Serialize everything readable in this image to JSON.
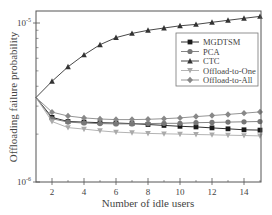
{
  "chart_data": {
    "type": "line",
    "title": "",
    "xlabel": "Number of idle users",
    "ylabel": "Offloading failure probability",
    "xlim": [
      1,
      15
    ],
    "ylim": [
      1e-06,
      1.2e-05
    ],
    "yscale": "log",
    "x_ticks": [
      2,
      4,
      6,
      8,
      10,
      12,
      14
    ],
    "y_tick_labels": [
      "10^-6",
      "10^-5"
    ],
    "grid": false,
    "legend_position": "upper right (inside)",
    "x": [
      1,
      2,
      3,
      4,
      5,
      6,
      7,
      8,
      9,
      10,
      11,
      12,
      13,
      14,
      15
    ],
    "series": [
      {
        "name": "MGDTSM",
        "marker": "square",
        "color": "#1a1a1a",
        "values": [
          3.4e-06,
          2.55e-06,
          2.4e-06,
          2.38e-06,
          2.36e-06,
          2.35e-06,
          2.33e-06,
          2.3e-06,
          2.27e-06,
          2.24e-06,
          2.22e-06,
          2.19e-06,
          2.16e-06,
          2.13e-06,
          2.12e-06
        ]
      },
      {
        "name": "PCA",
        "marker": "circle",
        "color": "#777777",
        "values": [
          3.4e-06,
          2.5e-06,
          2.38e-06,
          2.35e-06,
          2.33e-06,
          2.32e-06,
          2.32e-06,
          2.33e-06,
          2.34e-06,
          2.34e-06,
          2.36e-06,
          2.37e-06,
          2.38e-06,
          2.39e-06,
          2.4e-06
        ]
      },
      {
        "name": "CTC",
        "marker": "triangle-up",
        "color": "#333333",
        "values": [
          3.4e-06,
          4.3e-06,
          5.3e-06,
          6.3e-06,
          7.3e-06,
          8.1e-06,
          8.6e-06,
          9e-06,
          9.3e-06,
          9.6e-06,
          9.8e-06,
          1.01e-05,
          1.04e-05,
          1.07e-05,
          1.1e-05
        ]
      },
      {
        "name": "Offload-to-One",
        "marker": "triangle-down",
        "color": "#aaaaaa",
        "values": [
          3.4e-06,
          2.4e-06,
          2.2e-06,
          2.15e-06,
          2.1e-06,
          2.06e-06,
          2.04e-06,
          2.02e-06,
          2.01e-06,
          2e-06,
          1.99e-06,
          1.98e-06,
          1.97e-06,
          1.96e-06,
          1.95e-06
        ]
      },
      {
        "name": "Offload-to-All",
        "marker": "diamond",
        "color": "#888888",
        "values": [
          3.4e-06,
          2.75e-06,
          2.6e-06,
          2.53e-06,
          2.49e-06,
          2.47e-06,
          2.47e-06,
          2.48e-06,
          2.5e-06,
          2.53e-06,
          2.58e-06,
          2.62e-06,
          2.66e-06,
          2.71e-06,
          2.76e-06
        ]
      }
    ]
  },
  "axes": {
    "xlabel": "Number of idle users",
    "ylabel": "Offloading failure probability",
    "x_tick_labels": [
      "2",
      "4",
      "6",
      "8",
      "10",
      "12",
      "14"
    ],
    "y_top_label_base": "10",
    "y_top_label_exp": "-5",
    "y_bottom_label_base": "10",
    "y_bottom_label_exp": "-6"
  },
  "legend": {
    "items": [
      {
        "label": "MGDTSM",
        "marker": "square"
      },
      {
        "label": "PCA",
        "marker": "circle"
      },
      {
        "label": "CTC",
        "marker": "triangle-up"
      },
      {
        "label": "Offload-to-One",
        "marker": "triangle-down"
      },
      {
        "label": "Offload-to-All",
        "marker": "diamond"
      }
    ]
  }
}
